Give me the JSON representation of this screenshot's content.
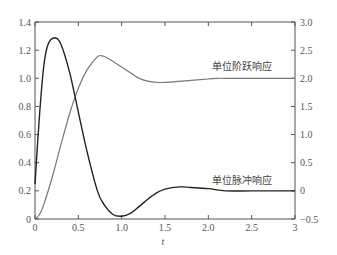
{
  "chart_data": {
    "type": "line",
    "title": "",
    "xlabel": "t",
    "ylabel_left": "",
    "ylabel_right": "",
    "xlim": [
      0,
      3
    ],
    "ylim_left": [
      0,
      1.4
    ],
    "ylim_right": [
      -0.5,
      3.0
    ],
    "grid": false,
    "legend": "none (inline annotations)",
    "x_ticks": [
      "0",
      "0.5",
      "1.0",
      "1.5",
      "2.0",
      "2.5",
      "3"
    ],
    "y_ticks_left": [
      "0",
      "0.2",
      "0.4",
      "0.6",
      "0.8",
      "1.0",
      "1.2",
      "1.4"
    ],
    "y_ticks_right": [
      "−0.5",
      "0",
      "0.5",
      "1.0",
      "1.5",
      "2.0",
      "2.5",
      "3.0"
    ],
    "series": [
      {
        "name": "单位阶跃响应",
        "axis": "left",
        "color": "#777777",
        "x": [
          0,
          0.05,
          0.1,
          0.2,
          0.3,
          0.4,
          0.5,
          0.6,
          0.7,
          0.74,
          0.8,
          0.9,
          1.0,
          1.1,
          1.2,
          1.3,
          1.44,
          1.6,
          1.8,
          2.0,
          2.1,
          2.2,
          2.5,
          3.0
        ],
        "values": [
          0,
          0.03,
          0.1,
          0.3,
          0.53,
          0.75,
          0.93,
          1.06,
          1.14,
          1.16,
          1.155,
          1.12,
          1.08,
          1.04,
          1.0,
          0.98,
          0.97,
          0.975,
          0.985,
          0.995,
          1.0,
          1.0,
          1.0,
          1.0
        ]
      },
      {
        "name": "单位脉冲响应",
        "axis": "right",
        "color": "#222222",
        "x": [
          0,
          0.05,
          0.1,
          0.15,
          0.23,
          0.3,
          0.4,
          0.5,
          0.6,
          0.72,
          0.8,
          0.9,
          1.0,
          1.1,
          1.2,
          1.3,
          1.4,
          1.5,
          1.67,
          1.8,
          2.0,
          2.2,
          2.5,
          3.0
        ],
        "values": [
          0.12,
          1.3,
          2.2,
          2.6,
          2.72,
          2.6,
          2.1,
          1.4,
          0.7,
          0.0,
          -0.25,
          -0.42,
          -0.45,
          -0.4,
          -0.28,
          -0.15,
          -0.04,
          0.03,
          0.07,
          0.06,
          0.04,
          0.0,
          0.0,
          0.0
        ]
      }
    ],
    "annotations": [
      {
        "text": "单位阶跃响应",
        "x": 2.3,
        "y_left": 1.05
      },
      {
        "text": "单位脉冲响应",
        "x": 2.3,
        "y_right": 0.12
      }
    ]
  }
}
